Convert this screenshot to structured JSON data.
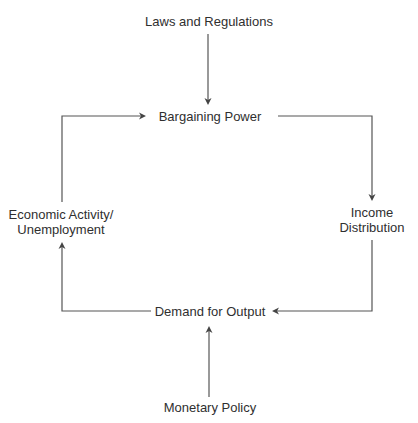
{
  "diagram": {
    "header_cutoff_text": "",
    "nodes": {
      "laws": "Laws and Regulations",
      "bargaining": "Bargaining Power",
      "income_line1": "Income",
      "income_line2": "Distribution",
      "economic_line1": "Economic Activity/",
      "economic_line2": "Unemployment",
      "demand": "Demand for Output",
      "monetary": "Monetary Policy"
    },
    "edges": [
      {
        "from": "Laws and Regulations",
        "to": "Bargaining Power"
      },
      {
        "from": "Bargaining Power",
        "to": "Income Distribution"
      },
      {
        "from": "Income Distribution",
        "to": "Demand for Output"
      },
      {
        "from": "Demand for Output",
        "to": "Economic Activity/Unemployment"
      },
      {
        "from": "Economic Activity/Unemployment",
        "to": "Bargaining Power"
      },
      {
        "from": "Monetary Policy",
        "to": "Demand for Output"
      }
    ],
    "colors": {
      "line": "#555555",
      "text": "#2f2f2f",
      "background": "#ffffff"
    }
  }
}
